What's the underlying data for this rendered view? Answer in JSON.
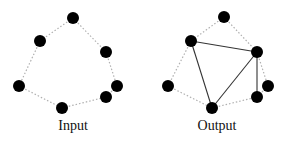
{
  "panels": [
    {
      "label": "Input",
      "label_x": 33,
      "nodes": [
        [
          73,
          18
        ],
        [
          40,
          41
        ],
        [
          106,
          52
        ],
        [
          19,
          86
        ],
        [
          117,
          86
        ],
        [
          106,
          97
        ],
        [
          62,
          108
        ]
      ],
      "dotted_edges": [
        [
          0,
          1
        ],
        [
          0,
          2
        ],
        [
          1,
          3
        ],
        [
          2,
          4
        ],
        [
          3,
          6
        ],
        [
          6,
          5
        ],
        [
          4,
          5
        ]
      ],
      "solid_edges": []
    },
    {
      "label": "Output",
      "label_x": 177,
      "nodes": [
        [
          224,
          17
        ],
        [
          191,
          41
        ],
        [
          257,
          52
        ],
        [
          168,
          86
        ],
        [
          268,
          86
        ],
        [
          257,
          97
        ],
        [
          212,
          108
        ]
      ],
      "dotted_edges": [
        [
          0,
          1
        ],
        [
          0,
          2
        ],
        [
          1,
          3
        ],
        [
          2,
          4
        ],
        [
          3,
          6
        ],
        [
          6,
          5
        ],
        [
          4,
          5
        ]
      ],
      "solid_edges": [
        [
          1,
          2
        ],
        [
          1,
          6
        ],
        [
          6,
          2
        ],
        [
          2,
          5
        ]
      ]
    }
  ],
  "style": {
    "node_color": "#000000",
    "dotted_color": "#b0b0b0",
    "solid_color": "#333333",
    "node_radius": 6
  }
}
